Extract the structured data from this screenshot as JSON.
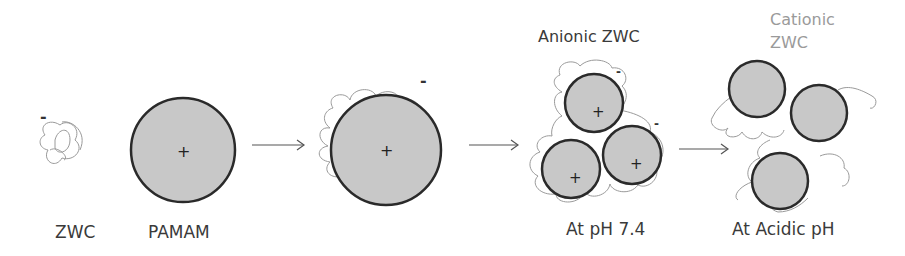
{
  "labels": {
    "zwc": "ZWC",
    "pamam": "PAMAM",
    "anionic_zwc": "Anionic ZWC",
    "cationic_zwc_line1": "Cationic",
    "cationic_zwc_line2": "ZWC",
    "ph74": "At pH 7.4",
    "acidic_ph": "At Acidic pH"
  },
  "charges": {
    "negative": "-",
    "positive": "+"
  },
  "colors": {
    "particle_fill": "#c8c8c8",
    "particle_stroke": "#2a2a2a",
    "polymer_stroke": "#9a9a9a",
    "arrow": "#555555",
    "text": "#3a3a3a",
    "text_light": "#9a9a9a"
  }
}
